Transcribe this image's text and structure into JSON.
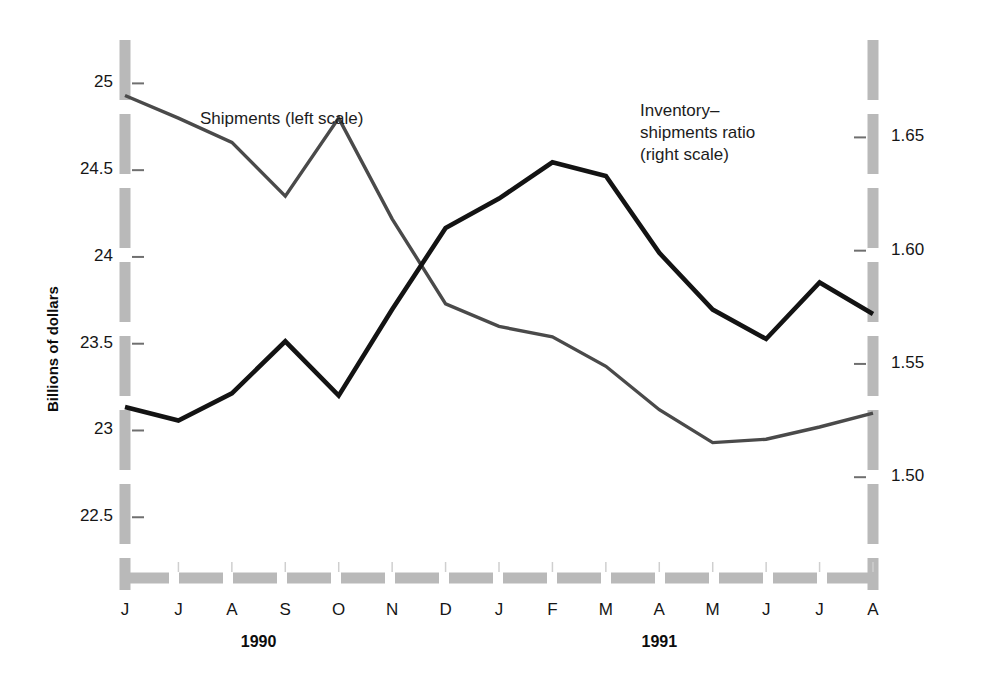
{
  "chart_data": {
    "type": "line",
    "title": "",
    "subtitle": "",
    "xlabel": "",
    "ylabel": "Billions of dollars",
    "y2label": "",
    "grid": false,
    "legend_position": "inline-annotation",
    "categories": [
      "J",
      "J",
      "A",
      "S",
      "O",
      "N",
      "D",
      "J",
      "F",
      "M",
      "A",
      "M",
      "J",
      "J",
      "A"
    ],
    "year_groups": [
      {
        "label": "1990",
        "start_index": 0,
        "end_index": 5
      },
      {
        "label": "1991",
        "start_index": 6,
        "end_index": 14
      }
    ],
    "left_axis": {
      "ticks": [
        "22.5",
        "23",
        "23.5",
        "24",
        "24.5",
        "25"
      ],
      "tick_values": [
        22.5,
        23,
        23.5,
        24,
        24.5,
        25
      ],
      "ylim": [
        22.15,
        25.25
      ]
    },
    "right_axis": {
      "ticks": [
        "1.50",
        "1.55",
        "1.60",
        "1.65"
      ],
      "tick_values": [
        1.5,
        1.55,
        1.6,
        1.65
      ],
      "ylim": [
        1.4555,
        1.693
      ]
    },
    "series": [
      {
        "name": "Shipments (left scale)",
        "axis": "left",
        "unit": "Billions of dollars",
        "color": "#4a4a4a",
        "values": [
          24.93,
          24.8,
          24.66,
          24.35,
          24.8,
          24.22,
          23.73,
          23.6,
          23.54,
          23.37,
          23.12,
          22.93,
          22.95,
          23.02,
          23.1
        ]
      },
      {
        "name": "Inventory–shipments ratio (right scale)",
        "axis": "right",
        "unit": "ratio",
        "color": "#131313",
        "values": [
          1.531,
          1.525,
          1.537,
          1.56,
          1.536,
          1.574,
          1.61,
          1.623,
          1.639,
          1.633,
          1.599,
          1.574,
          1.561,
          1.586,
          1.572
        ]
      }
    ],
    "annotations": [
      {
        "name": "shipments-legend",
        "text": "Shipments (left scale)",
        "x": 200,
        "y": 112
      },
      {
        "name": "ratio-legend",
        "text": "Inventory–\nshipments ratio\n(right scale)",
        "x": 640,
        "y": 103
      }
    ],
    "colors": {
      "axis_band": "#b9b9b9",
      "shipments_line": "#4a4a4a",
      "ratio_line": "#131313",
      "text": "#161616",
      "background": "#ffffff"
    }
  },
  "labels": {
    "ylabel_left": "Billions of dollars",
    "legend_shipments": "Shipments (left scale)",
    "legend_ratio_line1": "Inventory–",
    "legend_ratio_line2": "shipments ratio",
    "legend_ratio_line3": "(right scale)",
    "year_1990": "1990",
    "year_1991": "1991"
  }
}
